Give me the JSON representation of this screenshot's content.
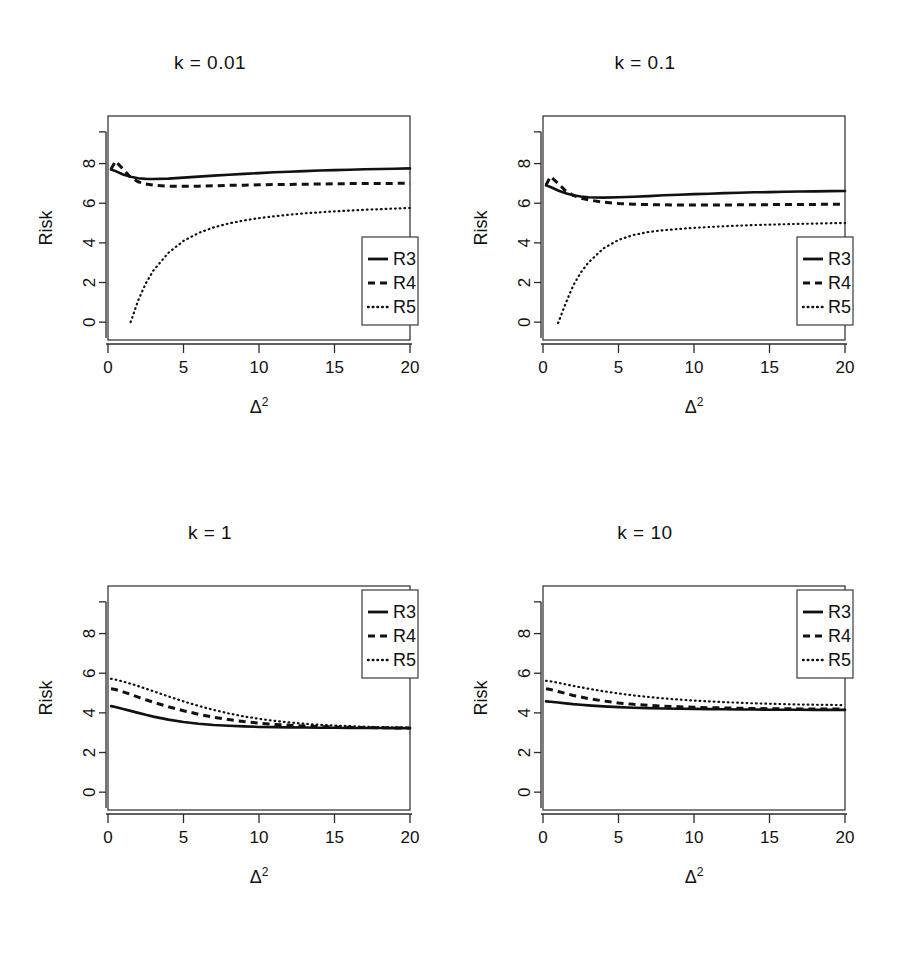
{
  "figure": {
    "name": "risk-comparison-figure",
    "axis_label_y": "Risk",
    "axis_label_x_base": "Δ",
    "axis_label_x_exp": "2",
    "line_color": "#111111",
    "background": "#ffffff"
  },
  "legend": {
    "entries": [
      {
        "label": "R3",
        "style": "solid"
      },
      {
        "label": "R4",
        "style": "dashed"
      },
      {
        "label": "R5",
        "style": "dotted"
      }
    ]
  },
  "chart_data": [
    {
      "type": "line",
      "title": "k = 0.01",
      "xlabel": "Δ2",
      "ylabel": "Risk",
      "xlim": [
        0,
        20
      ],
      "ylim": [
        -0.9,
        10.4
      ],
      "xticks": [
        0,
        5,
        10,
        15,
        20
      ],
      "yticks": [
        0,
        2,
        4,
        6,
        8
      ],
      "grid": false,
      "legend_position": "bottom-right",
      "x": [
        0.2,
        0.5,
        1,
        1.5,
        2,
        2.5,
        3,
        4,
        5,
        6,
        7,
        8,
        9,
        10,
        11,
        12,
        13,
        14,
        15,
        16,
        17,
        18,
        19,
        20
      ],
      "series": [
        {
          "name": "R3",
          "style": "solid",
          "values": [
            7.7,
            7.62,
            7.45,
            7.33,
            7.26,
            7.23,
            7.22,
            7.24,
            7.29,
            7.34,
            7.39,
            7.44,
            7.48,
            7.52,
            7.56,
            7.59,
            7.62,
            7.65,
            7.67,
            7.69,
            7.71,
            7.73,
            7.74,
            7.76
          ]
        },
        {
          "name": "R4",
          "style": "dashed",
          "values": [
            7.72,
            8.12,
            7.72,
            7.3,
            7.08,
            6.97,
            6.91,
            6.86,
            6.85,
            6.86,
            6.88,
            6.9,
            6.91,
            6.93,
            6.94,
            6.95,
            6.96,
            6.97,
            6.98,
            6.99,
            6.99,
            7.0,
            7.0,
            7.01
          ]
        },
        {
          "name": "R5",
          "style": "dotted",
          "values": [
            null,
            null,
            null,
            0.0,
            1.1,
            1.95,
            2.6,
            3.5,
            4.1,
            4.5,
            4.78,
            4.98,
            5.13,
            5.25,
            5.34,
            5.42,
            5.49,
            5.54,
            5.59,
            5.63,
            5.67,
            5.7,
            5.73,
            5.76
          ]
        }
      ]
    },
    {
      "type": "line",
      "title": "k = 0.1",
      "xlabel": "Δ2",
      "ylabel": "Risk",
      "xlim": [
        0,
        20
      ],
      "ylim": [
        -0.9,
        10.4
      ],
      "xticks": [
        0,
        5,
        10,
        15,
        20
      ],
      "yticks": [
        0,
        2,
        4,
        6,
        8
      ],
      "grid": false,
      "legend_position": "bottom-right",
      "x": [
        0.2,
        0.5,
        1,
        1.5,
        2,
        2.5,
        3,
        4,
        5,
        6,
        7,
        8,
        9,
        10,
        11,
        12,
        13,
        14,
        15,
        16,
        17,
        18,
        19,
        20
      ],
      "series": [
        {
          "name": "R3",
          "style": "solid",
          "values": [
            6.9,
            6.82,
            6.64,
            6.5,
            6.4,
            6.34,
            6.3,
            6.28,
            6.3,
            6.33,
            6.36,
            6.4,
            6.43,
            6.46,
            6.48,
            6.51,
            6.53,
            6.55,
            6.56,
            6.58,
            6.59,
            6.6,
            6.61,
            6.62
          ]
        },
        {
          "name": "R4",
          "style": "dashed",
          "values": [
            6.92,
            7.35,
            7.0,
            6.62,
            6.4,
            6.26,
            6.17,
            6.05,
            5.99,
            5.95,
            5.93,
            5.92,
            5.91,
            5.91,
            5.91,
            5.91,
            5.92,
            5.92,
            5.93,
            5.93,
            5.94,
            5.94,
            5.95,
            5.95
          ]
        },
        {
          "name": "R5",
          "style": "dotted",
          "values": [
            null,
            null,
            -0.05,
            0.95,
            1.85,
            2.5,
            3.0,
            3.72,
            4.15,
            4.4,
            4.55,
            4.64,
            4.7,
            4.76,
            4.8,
            4.84,
            4.87,
            4.9,
            4.92,
            4.94,
            4.96,
            4.97,
            4.99,
            5.0
          ]
        }
      ]
    },
    {
      "type": "line",
      "title": "k = 1",
      "xlabel": "Δ2",
      "ylabel": "Risk",
      "xlim": [
        0,
        20
      ],
      "ylim": [
        -0.9,
        10.4
      ],
      "xticks": [
        0,
        5,
        10,
        15,
        20
      ],
      "yticks": [
        0,
        2,
        4,
        6,
        8
      ],
      "grid": false,
      "legend_position": "top-right",
      "x": [
        0.2,
        0.5,
        1,
        1.5,
        2,
        2.5,
        3,
        4,
        5,
        6,
        7,
        8,
        9,
        10,
        11,
        12,
        13,
        14,
        15,
        16,
        17,
        18,
        19,
        20
      ],
      "series": [
        {
          "name": "R3",
          "style": "solid",
          "values": [
            4.34,
            4.3,
            4.2,
            4.1,
            4.0,
            3.9,
            3.81,
            3.66,
            3.54,
            3.45,
            3.39,
            3.35,
            3.32,
            3.29,
            3.28,
            3.27,
            3.26,
            3.25,
            3.25,
            3.24,
            3.24,
            3.24,
            3.23,
            3.23
          ]
        },
        {
          "name": "R4",
          "style": "dashed",
          "values": [
            5.22,
            5.18,
            5.06,
            4.93,
            4.79,
            4.66,
            4.54,
            4.31,
            4.11,
            3.93,
            3.78,
            3.66,
            3.56,
            3.48,
            3.42,
            3.38,
            3.34,
            3.31,
            3.29,
            3.27,
            3.26,
            3.25,
            3.24,
            3.24
          ]
        },
        {
          "name": "R5",
          "style": "dotted",
          "values": [
            5.72,
            5.68,
            5.58,
            5.47,
            5.35,
            5.22,
            5.09,
            4.83,
            4.58,
            4.35,
            4.15,
            3.97,
            3.82,
            3.7,
            3.6,
            3.52,
            3.45,
            3.4,
            3.36,
            3.33,
            3.3,
            3.28,
            3.27,
            3.26
          ]
        }
      ]
    },
    {
      "type": "line",
      "title": "k = 10",
      "xlabel": "Δ2",
      "ylabel": "Risk",
      "xlim": [
        0,
        20
      ],
      "ylim": [
        -0.9,
        10.4
      ],
      "xticks": [
        0,
        5,
        10,
        15,
        20
      ],
      "yticks": [
        0,
        2,
        4,
        6,
        8
      ],
      "grid": false,
      "legend_position": "top-right",
      "x": [
        0.2,
        0.5,
        1,
        1.5,
        2,
        2.5,
        3,
        4,
        5,
        6,
        7,
        8,
        9,
        10,
        11,
        12,
        13,
        14,
        15,
        16,
        17,
        18,
        19,
        20
      ],
      "series": [
        {
          "name": "R3",
          "style": "solid",
          "values": [
            4.58,
            4.56,
            4.52,
            4.48,
            4.44,
            4.41,
            4.38,
            4.33,
            4.29,
            4.26,
            4.24,
            4.22,
            4.21,
            4.2,
            4.19,
            4.18,
            4.17,
            4.17,
            4.16,
            4.16,
            4.16,
            4.15,
            4.15,
            4.15
          ]
        },
        {
          "name": "R4",
          "style": "dashed",
          "values": [
            5.22,
            5.18,
            5.08,
            4.98,
            4.88,
            4.8,
            4.72,
            4.6,
            4.5,
            4.43,
            4.38,
            4.34,
            4.31,
            4.28,
            4.26,
            4.25,
            4.23,
            4.22,
            4.21,
            4.21,
            4.2,
            4.2,
            4.19,
            4.19
          ]
        },
        {
          "name": "R5",
          "style": "dotted",
          "values": [
            5.62,
            5.59,
            5.52,
            5.44,
            5.36,
            5.29,
            5.22,
            5.09,
            4.98,
            4.88,
            4.8,
            4.73,
            4.67,
            4.62,
            4.58,
            4.54,
            4.51,
            4.48,
            4.46,
            4.44,
            4.42,
            4.41,
            4.4,
            4.39
          ]
        }
      ]
    }
  ]
}
